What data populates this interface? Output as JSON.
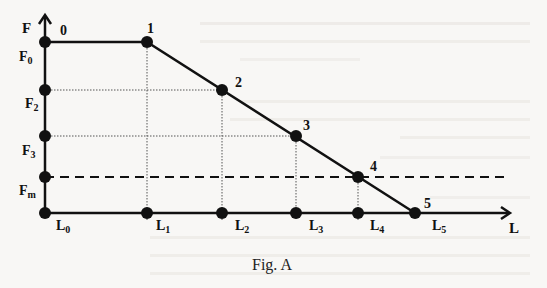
{
  "figure": {
    "caption": "Fig. A",
    "axes": {
      "y_label": "F",
      "x_label": "L"
    },
    "points": [
      {
        "id": "0",
        "label": "0"
      },
      {
        "id": "1",
        "label": "1"
      },
      {
        "id": "2",
        "label": "2"
      },
      {
        "id": "3",
        "label": "3"
      },
      {
        "id": "4",
        "label": "4"
      },
      {
        "id": "5",
        "label": "5"
      }
    ],
    "y_ticks": [
      {
        "main": "F",
        "sub": "0"
      },
      {
        "main": "F",
        "sub": "2"
      },
      {
        "main": "F",
        "sub": "3"
      },
      {
        "main": "F",
        "sub": "m"
      }
    ],
    "x_ticks": [
      {
        "main": "L",
        "sub": "0"
      },
      {
        "main": "L",
        "sub": "1"
      },
      {
        "main": "L",
        "sub": "2"
      },
      {
        "main": "L",
        "sub": "3"
      },
      {
        "main": "L",
        "sub": "4"
      },
      {
        "main": "L",
        "sub": "5"
      }
    ],
    "colors": {
      "line": "#111111",
      "guide": "#555555",
      "background": "#f8f7f5"
    }
  }
}
